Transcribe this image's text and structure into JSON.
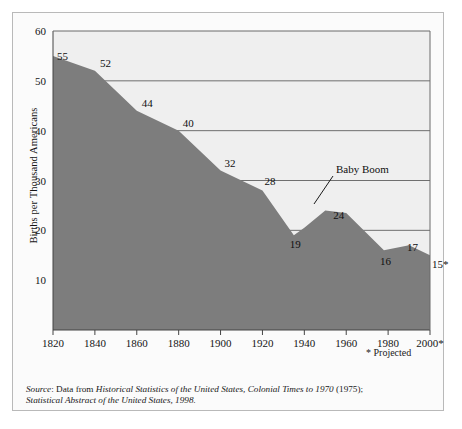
{
  "figure": {
    "ylabel": "Births per Thousand Americans",
    "projected_note": "* Projected",
    "source_prefix": "Source",
    "source_line1_a": ": Data from ",
    "source_line1_b": "Historical Statistics of the United States, Colonial Times to 1970",
    "source_line1_c": " (1975);",
    "source_line2": "Statistical Abstract of the United States, 1998."
  },
  "chart_data": {
    "type": "area",
    "title": "",
    "xlabel": "",
    "ylabel": "Births per Thousand Americans",
    "xlim": [
      1820,
      2000
    ],
    "ylim": [
      0,
      60
    ],
    "grid": true,
    "legend": null,
    "fill_color": "#7d7d7d",
    "plot_bg": "#efefef",
    "xticks": [
      1820,
      1840,
      1860,
      1880,
      1900,
      1920,
      1940,
      1960,
      1980,
      2000
    ],
    "xticklabels": [
      "1820",
      "1840",
      "1860",
      "1880",
      "1900",
      "1920",
      "1940",
      "1960",
      "1980",
      "2000*"
    ],
    "yticks": [
      10,
      20,
      30,
      40,
      50,
      60
    ],
    "yticklabels": [
      "10",
      "20",
      "30",
      "40",
      "50",
      "60"
    ],
    "x": [
      1820,
      1840,
      1860,
      1880,
      1900,
      1920,
      1935,
      1940,
      1950,
      1960,
      1978,
      1990,
      2000
    ],
    "y": [
      55,
      52,
      44,
      40,
      32,
      28,
      19,
      20.5,
      24,
      23.5,
      16,
      17,
      15
    ],
    "point_labels": [
      {
        "x": 1820,
        "y": 55,
        "text": "55"
      },
      {
        "x": 1840,
        "y": 52,
        "text": "52"
      },
      {
        "x": 1860,
        "y": 44,
        "text": "44"
      },
      {
        "x": 1880,
        "y": 40,
        "text": "40"
      },
      {
        "x": 1900,
        "y": 32,
        "text": "32"
      },
      {
        "x": 1920,
        "y": 28,
        "text": "28"
      },
      {
        "x": 1935,
        "y": 19,
        "text": "19"
      },
      {
        "x": 1950,
        "y": 24,
        "text": "24"
      },
      {
        "x": 1978,
        "y": 16,
        "text": "16"
      },
      {
        "x": 1990,
        "y": 17,
        "text": "17"
      },
      {
        "x": 2000,
        "y": 15,
        "text": "15*"
      }
    ],
    "annotations": [
      {
        "text": "Baby Boom",
        "x": 1950,
        "y": 24
      }
    ]
  }
}
